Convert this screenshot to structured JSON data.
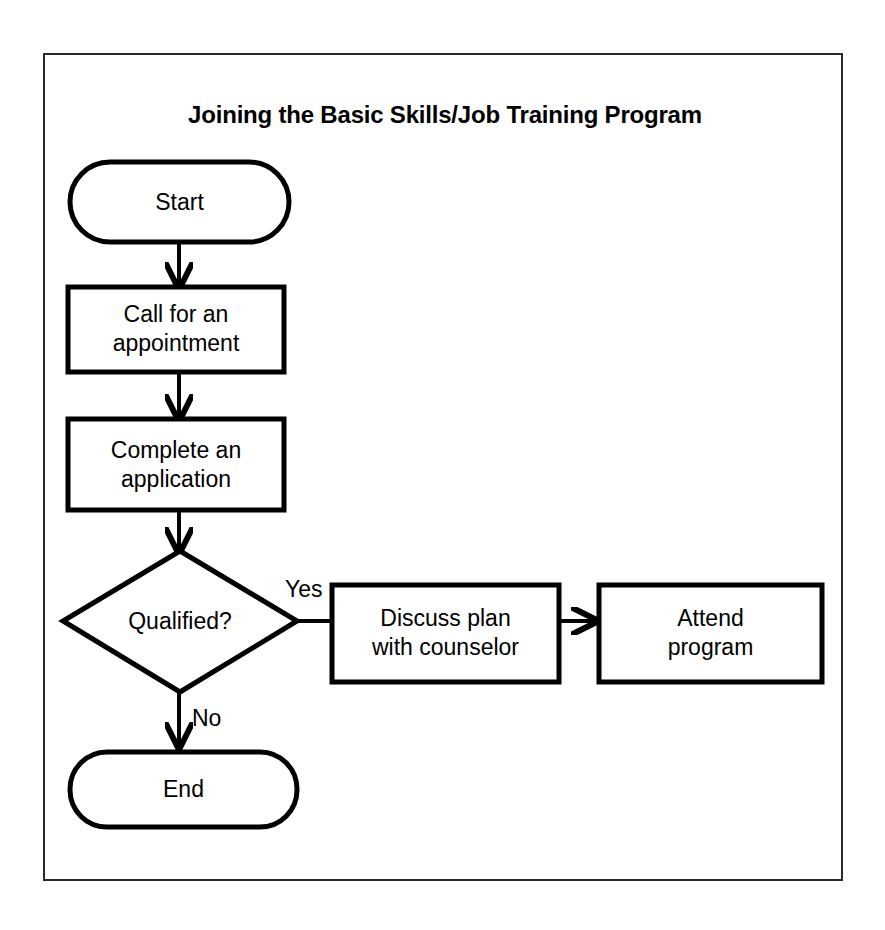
{
  "figure": {
    "title": "Joining the Basic Skills/Job Training Program",
    "border_color": "#2a2a2a",
    "background_color": "#ffffff",
    "stroke_color": "#000000"
  },
  "nodes": [
    {
      "id": "start",
      "shape": "terminator",
      "label": "Start"
    },
    {
      "id": "call",
      "shape": "process",
      "label": "Call for an\nappointment"
    },
    {
      "id": "application",
      "shape": "process",
      "label": "Complete an\napplication"
    },
    {
      "id": "qualified",
      "shape": "decision",
      "label": "Qualified?"
    },
    {
      "id": "discuss",
      "shape": "process",
      "label": "Discuss plan\nwith counselor"
    },
    {
      "id": "attend",
      "shape": "process",
      "label": "Attend\nprogram"
    },
    {
      "id": "end",
      "shape": "terminator",
      "label": "End"
    }
  ],
  "edges": [
    {
      "from": "start",
      "to": "call",
      "label": ""
    },
    {
      "from": "call",
      "to": "application",
      "label": ""
    },
    {
      "from": "application",
      "to": "qualified",
      "label": ""
    },
    {
      "from": "qualified",
      "to": "discuss",
      "label": "Yes"
    },
    {
      "from": "discuss",
      "to": "attend",
      "label": ""
    },
    {
      "from": "qualified",
      "to": "end",
      "label": "No"
    }
  ],
  "edge_labels": {
    "yes": "Yes",
    "no": "No"
  }
}
